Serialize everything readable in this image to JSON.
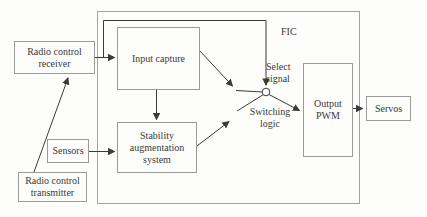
{
  "diagram": {
    "nodes": {
      "radio_control_receiver": {
        "label": "Radio control\nreceiver"
      },
      "radio_control_transmitter": {
        "label": "Radio control\ntransmitter"
      },
      "sensors": {
        "label": "Sensors"
      },
      "input_capture": {
        "label": "Input capture"
      },
      "stability_augmentation_system": {
        "label": "Stability\naugmentation\nsystem"
      },
      "output_pwm": {
        "label": "Output\nPWM"
      },
      "servos": {
        "label": "Servos"
      }
    },
    "annotations": {
      "fic": "FIC",
      "select_signal": "Select\nsignal",
      "switching_logic": "Switching\nlogic"
    },
    "connections": [
      "radio_control_transmitter -> radio_control_receiver",
      "radio_control_receiver -> input_capture",
      "radio_control_receiver -> select_signal (FIC bypass line)",
      "sensors -> stability_augmentation_system",
      "input_capture -> stability_augmentation_system",
      "input_capture -> switch contact",
      "stability_augmentation_system -> switch contact",
      "switch -> output_pwm",
      "output_pwm -> servos"
    ],
    "colors": {
      "background": "#fdfdfb",
      "box_border": "#9b9b9b",
      "frame_border": "#a3a3a3",
      "connector": "#3b3b3b",
      "text": "#3a3a3a"
    }
  }
}
